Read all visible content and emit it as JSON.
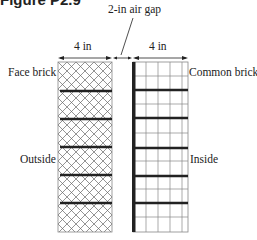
{
  "figure": {
    "title": "Figure P2.9",
    "labels": {
      "gap": "2-in air gap",
      "face_width": "4 in",
      "common_width": "4 in",
      "face_brick": "Face brick",
      "common_brick": "Common brick",
      "outside": "Outside",
      "inside": "Inside"
    }
  }
}
